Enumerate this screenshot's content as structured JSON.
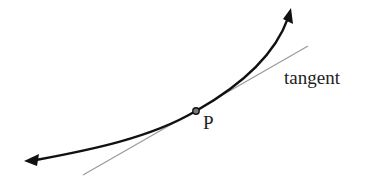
{
  "diagram": {
    "labels": {
      "tangent": "tangent",
      "point": "P"
    },
    "colors": {
      "curve": "#111111",
      "tangent_line": "#9a9a9a",
      "text": "#222222",
      "background": "#ffffff"
    },
    "elements": {
      "curve": {
        "start": [
          25,
          160
        ],
        "end": [
          291,
          9
        ],
        "arrows": "both ends"
      },
      "tangent_line": {
        "start": [
          83,
          175
        ],
        "end": [
          308,
          46
        ]
      },
      "point": {
        "name": "P",
        "position": [
          196,
          111
        ]
      }
    }
  }
}
